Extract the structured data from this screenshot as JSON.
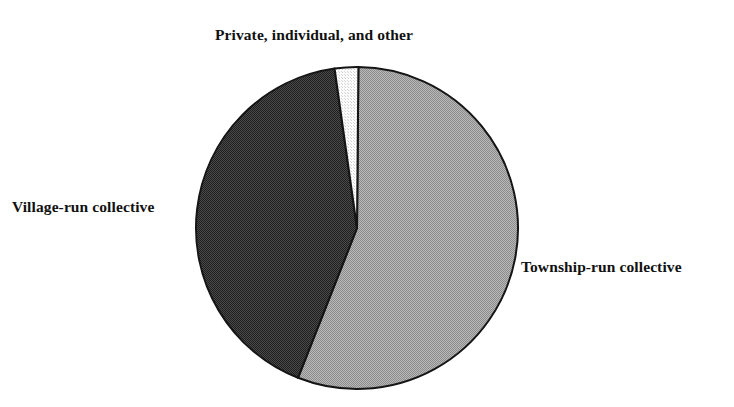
{
  "figure": {
    "type": "pie-chart",
    "background_color": "#ffffff",
    "text_color": "#111111"
  },
  "labels": {
    "private": "Private, individual, and other",
    "village": "Village-run collective",
    "township": "Township-run collective"
  },
  "chart_data": {
    "type": "pie",
    "title": "",
    "subtitle": "",
    "xlabel": "",
    "ylabel": "",
    "legend_position": "outside-labels",
    "grid": false,
    "start_angle_deg": 0,
    "direction": "clockwise",
    "center": {
      "x": 357,
      "y": 228
    },
    "radius": 161,
    "categories": [
      "Township-run collective",
      "Village-run collective",
      "Private, individual, and other"
    ],
    "values": [
      55.8,
      41.8,
      2.4
    ],
    "units": "percent",
    "slices": [
      {
        "label": "Township-run collective",
        "value": 55.8,
        "start_angle_deg": 0.5,
        "end_angle_deg": 201.5,
        "fill": "#a8a8a8",
        "pattern": "fine-checker",
        "stroke": "#1a1a1a",
        "label_position": "right"
      },
      {
        "label": "Village-run collective",
        "value": 41.8,
        "start_angle_deg": 201.5,
        "end_angle_deg": 352.0,
        "fill": "#3a3a3a",
        "pattern": "fine-checker",
        "stroke": "#1a1a1a",
        "label_position": "left"
      },
      {
        "label": "Private, individual, and other",
        "value": 2.4,
        "start_angle_deg": 352.0,
        "end_angle_deg": 360.5,
        "fill": "#f0f0f0",
        "pattern": "fine-dots",
        "stroke": "#1a1a1a",
        "label_position": "top"
      }
    ]
  }
}
